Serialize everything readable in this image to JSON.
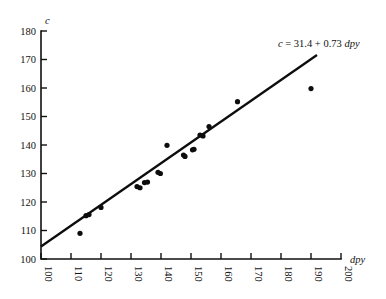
{
  "chart_data": {
    "type": "scatter",
    "title": "",
    "xlabel": "dpy",
    "ylabel": "c",
    "xlim": [
      100,
      200
    ],
    "ylim": [
      100,
      180
    ],
    "xticks": [
      100,
      110,
      120,
      130,
      140,
      150,
      160,
      170,
      180,
      190,
      200
    ],
    "yticks": [
      100,
      110,
      120,
      130,
      140,
      150,
      160,
      170,
      180
    ],
    "xtick_labels": [
      "100",
      "110",
      "120",
      "130",
      "140",
      "150",
      "160",
      "170",
      "180",
      "190",
      "200"
    ],
    "ytick_labels": [
      "100",
      "110",
      "120",
      "130",
      "140",
      "150",
      "160",
      "170",
      "180"
    ],
    "xtick_rotation": 90,
    "grid": false,
    "legend": "none",
    "points": [
      {
        "x": 113.0,
        "y": 109.0
      },
      {
        "x": 115.0,
        "y": 115.2
      },
      {
        "x": 116.0,
        "y": 115.6
      },
      {
        "x": 120.0,
        "y": 118.1
      },
      {
        "x": 132.0,
        "y": 125.4
      },
      {
        "x": 133.0,
        "y": 125.0
      },
      {
        "x": 134.5,
        "y": 126.8
      },
      {
        "x": 135.5,
        "y": 127.0
      },
      {
        "x": 139.0,
        "y": 130.4
      },
      {
        "x": 139.8,
        "y": 130.0
      },
      {
        "x": 142.0,
        "y": 139.9
      },
      {
        "x": 147.5,
        "y": 136.5
      },
      {
        "x": 148.0,
        "y": 136.0
      },
      {
        "x": 150.5,
        "y": 138.3
      },
      {
        "x": 151.0,
        "y": 138.5
      },
      {
        "x": 153.0,
        "y": 143.5
      },
      {
        "x": 154.0,
        "y": 143.2
      },
      {
        "x": 156.0,
        "y": 146.5
      },
      {
        "x": 165.5,
        "y": 155.2
      },
      {
        "x": 190.0,
        "y": 159.8
      }
    ],
    "fit": {
      "intercept": 31.4,
      "slope": 0.73,
      "equation_prefix": "c",
      "equation_body": " = 31.4 + 0.73 ",
      "equation_var": "dpy",
      "equation_full": "c = 31.4 + 0.73 dpy",
      "x_start": 100,
      "x_end": 192
    },
    "marker_radius": 2.6,
    "point_color": "#0d0d0d",
    "line_color": "#0d0d0d",
    "axis_color": "#111111",
    "background": "#ffffff"
  }
}
